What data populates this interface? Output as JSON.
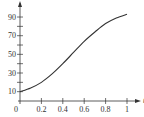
{
  "chart_data": {
    "type": "line",
    "title": "",
    "xlabel": "t",
    "ylabel": "",
    "xlim": [
      0,
      1
    ],
    "ylim": [
      0,
      100
    ],
    "grid": false,
    "legend": null,
    "x_ticks": [
      0,
      0.2,
      0.4,
      0.6,
      0.8,
      1
    ],
    "x_tick_labels": [
      "0",
      "0.2",
      "0.4",
      "0.6",
      "0.8",
      "1"
    ],
    "y_ticks": [
      10,
      20,
      30,
      40,
      50,
      60,
      70,
      80,
      90
    ],
    "y_tick_labels": [
      "10",
      "30",
      "50",
      "70",
      "90"
    ],
    "y_labeled_ticks": [
      10,
      30,
      50,
      70,
      90
    ],
    "series": [
      {
        "name": "curve",
        "x": [
          0,
          0.1,
          0.2,
          0.3,
          0.4,
          0.5,
          0.6,
          0.7,
          0.8,
          0.9,
          1.0
        ],
        "values": [
          10,
          14,
          20,
          29,
          40,
          52,
          64,
          74,
          83,
          89,
          93
        ]
      }
    ],
    "colors": {
      "line": "#333333",
      "axis": "#333333"
    }
  }
}
